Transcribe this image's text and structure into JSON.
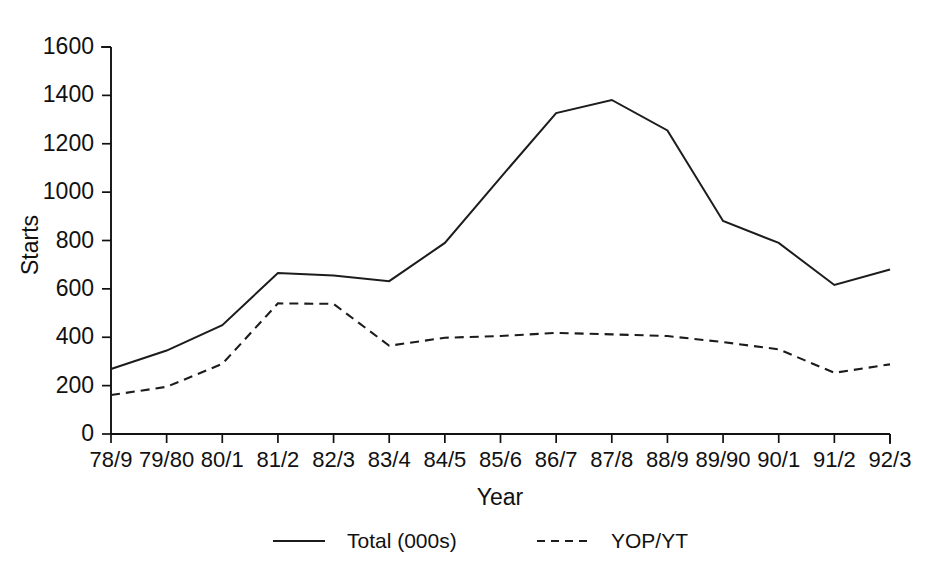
{
  "chart_data": {
    "type": "line",
    "title": "",
    "xlabel": "Year",
    "ylabel": "Starts",
    "categories": [
      "78/9",
      "79/80",
      "80/1",
      "81/2",
      "82/3",
      "83/4",
      "84/5",
      "85/6",
      "86/7",
      "87/8",
      "88/9",
      "89/90",
      "90/1",
      "91/2",
      "92/3"
    ],
    "ylim": [
      0,
      1600
    ],
    "ytick_labels": [
      "0",
      "200",
      "400",
      "600",
      "800",
      "1000",
      "1200",
      "1400",
      "1600"
    ],
    "ytick_values": [
      0,
      200,
      400,
      600,
      800,
      1000,
      1200,
      1400,
      1600
    ],
    "grid": false,
    "legend_position": "bottom",
    "series": [
      {
        "name": "Total (000s)",
        "style": "solid",
        "color": "#1c1c1c",
        "values": [
          269,
          345,
          450,
          666,
          655,
          632,
          790,
          1060,
          1327,
          1381,
          1255,
          881,
          790,
          616,
          680
        ]
      },
      {
        "name": "YOP/YT",
        "style": "dashed",
        "color": "#1c1c1c",
        "values": [
          161,
          195,
          290,
          540,
          538,
          365,
          398,
          405,
          418,
          412,
          405,
          380,
          350,
          253,
          288
        ]
      }
    ],
    "annotations": []
  },
  "legend": {
    "entries": [
      {
        "label": "Total (000s)",
        "style": "solid"
      },
      {
        "label": "YOP/YT",
        "style": "dashed"
      }
    ]
  },
  "axes": {
    "x_title": "Year",
    "y_title": "Starts"
  },
  "page": {
    "cut_header_text": ""
  }
}
